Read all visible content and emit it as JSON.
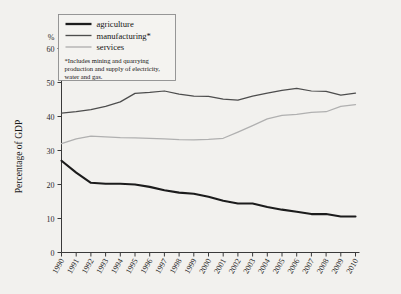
{
  "figure": {
    "background_color": "#f2f1ee",
    "ylabel": "Percentage of GDP",
    "percent_symbol": "%"
  },
  "legend": {
    "position": "top-left-inset",
    "entries": [
      {
        "key": "agriculture",
        "label": "agriculture",
        "color": "#1c1c1c"
      },
      {
        "key": "manufacturing",
        "label": "manufacturing*",
        "color": "#4d4d4d"
      },
      {
        "key": "services",
        "label": "services",
        "color": "#b0b0b0"
      }
    ],
    "note_line_1": "*Includes mining and quarrying",
    "note_line_2": "production and supply of electricity,",
    "note_line_3": "water and gas."
  },
  "chart_data": {
    "type": "line",
    "title": "",
    "xlabel": "",
    "ylabel": "Percentage of GDP",
    "ylim": [
      0,
      60
    ],
    "yticks": [
      0,
      10,
      20,
      30,
      40,
      50,
      60
    ],
    "ytick_labels": [
      "0",
      "10",
      "20",
      "30",
      "40",
      "50",
      "60"
    ],
    "grid": false,
    "legend_position": "upper left",
    "x": [
      1990,
      1991,
      1992,
      1993,
      1994,
      1995,
      1996,
      1997,
      1998,
      1999,
      2000,
      2001,
      2002,
      2003,
      2004,
      2005,
      2006,
      2007,
      2008,
      2009,
      2010
    ],
    "xtick_labels": [
      "1990",
      "1991",
      "1992",
      "1993",
      "1994",
      "1995",
      "1996",
      "1997",
      "1998",
      "1999",
      "2000",
      "2001",
      "2002",
      "2003",
      "2004",
      "2005",
      "2006",
      "2007",
      "2008",
      "2009",
      "2010"
    ],
    "series": [
      {
        "name": "agriculture",
        "color": "#1c1c1c",
        "values": [
          27.0,
          23.5,
          20.5,
          20.2,
          20.2,
          20.0,
          19.3,
          18.3,
          17.6,
          17.3,
          16.4,
          15.2,
          14.4,
          14.4,
          13.4,
          12.6,
          12.0,
          11.3,
          11.3,
          10.6,
          10.6
        ]
      },
      {
        "name": "manufacturing*",
        "color": "#4d4d4d",
        "values": [
          41.0,
          41.4,
          42.0,
          43.0,
          44.3,
          46.8,
          47.1,
          47.5,
          46.6,
          46.0,
          45.9,
          45.1,
          44.8,
          46.0,
          46.9,
          47.7,
          48.3,
          47.5,
          47.4,
          46.3,
          46.9
        ]
      },
      {
        "name": "services",
        "color": "#b0b0b0",
        "values": [
          32.0,
          33.4,
          34.2,
          34.0,
          33.8,
          33.7,
          33.6,
          33.4,
          33.2,
          33.1,
          33.3,
          33.6,
          35.4,
          37.3,
          39.3,
          40.3,
          40.6,
          41.2,
          41.4,
          43.0,
          43.5
        ]
      }
    ]
  }
}
